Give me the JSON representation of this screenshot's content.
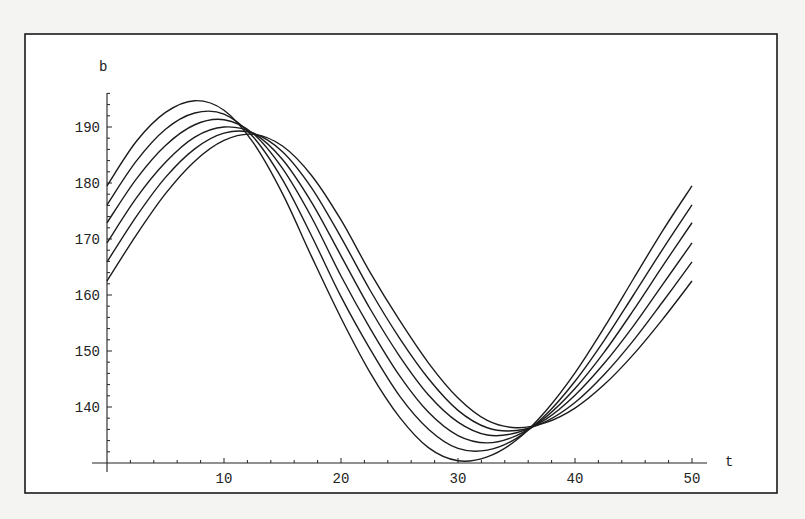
{
  "chart_data": {
    "type": "line",
    "title": "",
    "xlabel": "t",
    "ylabel": "b",
    "xlim": [
      0,
      50
    ],
    "ylim": [
      130,
      196
    ],
    "grid": false,
    "legend": null,
    "x_ticks": [
      10,
      20,
      30,
      40,
      50
    ],
    "y_ticks": [
      140,
      150,
      160,
      170,
      180,
      190
    ],
    "x_minor_step": 2,
    "y_minor_step": 2,
    "x": [
      0,
      2.5,
      5,
      7.5,
      10,
      12.5,
      15,
      17.5,
      20,
      22.5,
      25,
      27.5,
      30,
      32.5,
      35,
      37.5,
      40,
      42.5,
      45,
      47.5,
      50
    ],
    "series": [
      {
        "name": "curve-1",
        "values": [
          179.5,
          187.4,
          192.6,
          194.7,
          193.0,
          187.2,
          178.1,
          166.8,
          155.9,
          146.1,
          138.2,
          132.7,
          130.4,
          131.1,
          134.1,
          139.3,
          146.1,
          154.2,
          162.9,
          171.5,
          179.5
        ]
      },
      {
        "name": "curve-2",
        "values": [
          176.1,
          183.9,
          189.6,
          192.5,
          192.3,
          188.2,
          180.6,
          170.5,
          159.7,
          150.3,
          142.0,
          136.0,
          132.6,
          132.3,
          134.4,
          138.6,
          144.6,
          151.9,
          160.0,
          168.2,
          176.1
        ]
      },
      {
        "name": "curve-3",
        "values": [
          172.9,
          180.7,
          186.7,
          190.4,
          191.3,
          188.8,
          182.6,
          173.8,
          163.4,
          154.0,
          145.6,
          139.0,
          134.9,
          133.6,
          134.9,
          138.2,
          143.3,
          149.8,
          157.3,
          165.2,
          172.9
        ]
      },
      {
        "name": "curve-4",
        "values": [
          169.3,
          177.3,
          183.7,
          188.2,
          190.0,
          188.9,
          184.2,
          176.5,
          167.0,
          157.5,
          149.1,
          142.1,
          137.3,
          135.0,
          135.4,
          137.8,
          142.1,
          147.8,
          154.5,
          161.9,
          169.3
        ]
      },
      {
        "name": "curve-5",
        "values": [
          165.9,
          174.0,
          181.0,
          186.1,
          188.9,
          188.9,
          185.6,
          179.1,
          170.3,
          160.8,
          152.3,
          145.0,
          139.4,
          136.3,
          135.8,
          137.4,
          140.8,
          145.8,
          151.9,
          158.8,
          165.9
        ]
      },
      {
        "name": "curve-6",
        "values": [
          162.5,
          170.7,
          178.1,
          183.9,
          187.6,
          188.7,
          186.6,
          181.3,
          173.4,
          164.0,
          155.5,
          147.8,
          141.6,
          137.6,
          136.3,
          137.2,
          139.8,
          144.0,
          149.4,
          155.7,
          162.5
        ]
      }
    ],
    "annotations": []
  },
  "colors": {
    "background": "#f4f4f2",
    "plot_background": "#ffffff",
    "line": "#1c1c1c",
    "axis": "#222222"
  }
}
